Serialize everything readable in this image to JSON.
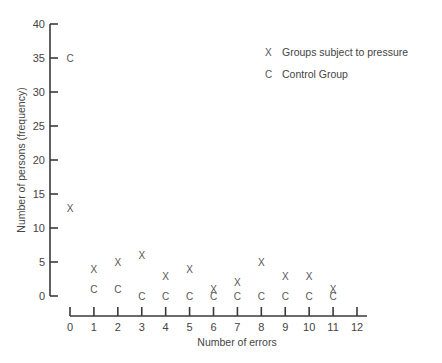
{
  "chart_data": {
    "type": "scatter",
    "title": "",
    "xlabel": "Number of errors",
    "ylabel": "Number of persons (frequency)",
    "x": [
      0,
      1,
      2,
      3,
      4,
      5,
      6,
      7,
      8,
      9,
      10,
      11,
      12
    ],
    "xticks": [
      "0",
      "1",
      "2",
      "3",
      "4",
      "5",
      "6",
      "7",
      "8",
      "9",
      "10",
      "11",
      "12"
    ],
    "yticks": [
      "0",
      "5",
      "10",
      "15",
      "20",
      "25",
      "30",
      "35",
      "40"
    ],
    "ylim": [
      0,
      40
    ],
    "xlim": [
      0,
      12
    ],
    "grid": false,
    "legend_position": "upper right",
    "series": [
      {
        "name": "Groups subject to pressure",
        "marker": "X",
        "x": [
          0,
          1,
          2,
          3,
          4,
          5,
          6,
          7,
          8,
          9,
          10,
          11
        ],
        "values": [
          13,
          4,
          5,
          6,
          3,
          4,
          1,
          2,
          5,
          3,
          3,
          1
        ]
      },
      {
        "name": "Control Group",
        "marker": "C",
        "x": [
          0,
          1,
          2,
          3,
          4,
          5,
          6,
          7,
          8,
          9,
          10,
          11
        ],
        "values": [
          35,
          1,
          1,
          0,
          0,
          0,
          0,
          0,
          0,
          0,
          0,
          0
        ]
      }
    ]
  },
  "legend": {
    "items": [
      {
        "marker": "X",
        "label": "Groups subject to pressure"
      },
      {
        "marker": "C",
        "label": "Control Group"
      }
    ]
  },
  "axes": {
    "x_title": "Number of errors",
    "y_title": "Number of persons (frequency)"
  },
  "colors": {
    "ink": "#3a3a3a",
    "background": "#ffffff"
  }
}
